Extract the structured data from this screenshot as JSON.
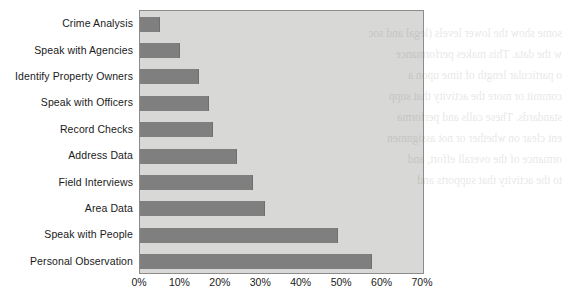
{
  "chart_data": {
    "type": "bar",
    "orientation": "horizontal",
    "title": "",
    "xlabel": "",
    "ylabel": "",
    "xlim": [
      0,
      70
    ],
    "xtick_labels": [
      "0%",
      "10%",
      "20%",
      "30%",
      "40%",
      "50%",
      "60%",
      "70%"
    ],
    "xtick_values": [
      0,
      10,
      20,
      30,
      40,
      50,
      60,
      70
    ],
    "grid": false,
    "legend": "none",
    "categories": [
      "Crime Analysis",
      "Speak with Agencies",
      "Identify Property Owners",
      "Speak with Officers",
      "Record Checks",
      "Address Data",
      "Field Interviews",
      "Area Data",
      "Speak with People",
      "Personal Observation"
    ],
    "values": [
      5,
      10,
      14.5,
      17,
      18,
      24,
      28,
      31,
      49,
      57.5
    ],
    "bar_color": "#7f7f7f",
    "plot_background": "#d8d8d6",
    "axis_color": "#8c8c8c"
  },
  "bleed_text": [
    "some show the lower levels (legal and soc",
    "w the data. This makes performance",
    "o particular length of time upon a",
    "commit or more the activity that supp",
    "standards. These calls and performa",
    "ent clear on whether or not assignmen",
    "ormance of the overall effort, and",
    "to the activity that supports and"
  ]
}
